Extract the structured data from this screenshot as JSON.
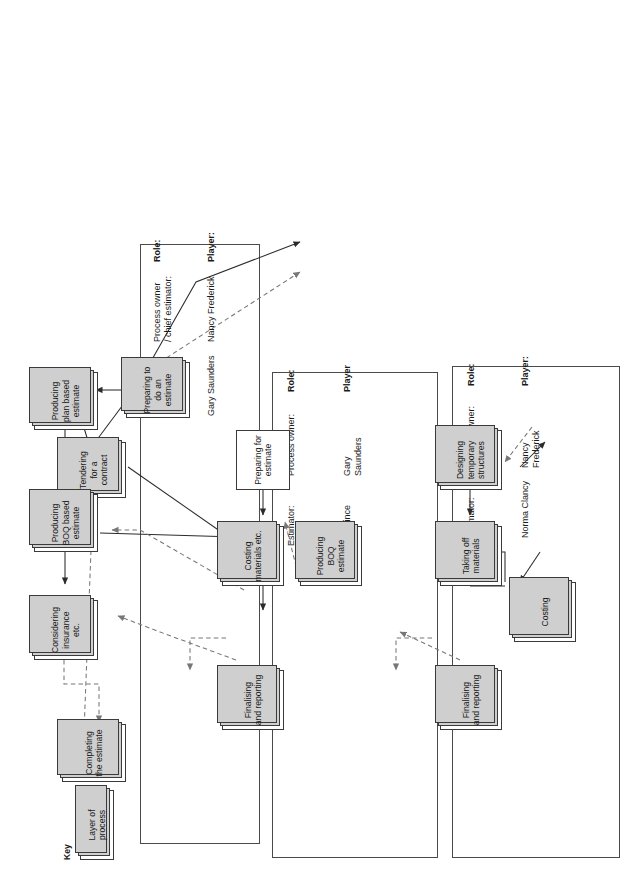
{
  "diagram": {
    "key": {
      "label": "Key",
      "sample_box": "Layer of\nprocess"
    },
    "top_process": {
      "label": "Tendering\nfor a\ncontract"
    },
    "lanes": [
      {
        "id": "lane-chief-estimator",
        "role_heading": "Role:",
        "player_heading": "Player:",
        "rows": [
          {
            "role": "Process owner\n/ chief estimator:",
            "player": "Nancy Frederick"
          },
          {
            "role": "Estimator:",
            "player": "Gary Saunders"
          }
        ],
        "processes": [
          {
            "id": "preparing-to-do-an-estimate",
            "label": "Preparing to\ndo an\nestimate"
          },
          {
            "id": "producing-plan-based-estimate",
            "label": "Producing\nplan based\nestimate"
          },
          {
            "id": "producing-boq-based-estimate",
            "label": "Producing\nBOQ based\nestimate"
          },
          {
            "id": "considering-insurance-etc",
            "label": "Considering\ninsurance etc."
          },
          {
            "id": "completing-the-estimate",
            "label": "Completing\nthe estimate"
          }
        ]
      },
      {
        "id": "lane-gary-saunders",
        "role_heading": "Role:",
        "player_heading": "Player",
        "rows": [
          {
            "role": "Process owner:",
            "player": "Gary\nSaunders"
          },
          {
            "role": "Estimator:",
            "player": "Joe Mince"
          }
        ],
        "processes": [
          {
            "id": "preparing-for-estimate",
            "label": "Preparing for\nestimate"
          },
          {
            "id": "costing-materials-etc",
            "label": "Costing\nmaterials etc."
          },
          {
            "id": "producing-boq-estimate",
            "label": "Producing\nBOQ estimate"
          },
          {
            "id": "finalising-and-reporting-gs",
            "label": "Finalising and\nreporting"
          }
        ]
      },
      {
        "id": "lane-norma-clancy",
        "role_heading": "Role:",
        "player_heading": "Player:",
        "rows": [
          {
            "role": "Process owner:",
            "player": "Nancy\nFrederick"
          },
          {
            "role": "Estimator:",
            "player": "Norma Clancy"
          }
        ],
        "processes": [
          {
            "id": "designing-temporary-structures",
            "label": "Designing\ntemporary\nstructures"
          },
          {
            "id": "taking-off-materials",
            "label": "Taking off\nmaterials"
          },
          {
            "id": "costing",
            "label": "Costing"
          },
          {
            "id": "finalising-and-reporting-nc",
            "label": "Finalising and\nreporting"
          }
        ]
      }
    ],
    "colors": {
      "line_solid": "#2b2b2b",
      "line_dashed": "#777777",
      "box_border": "#3a3a3a",
      "box_shadow": "#cfcfcf",
      "lane_border": "#4a4a4a",
      "background": "#ffffff"
    }
  }
}
